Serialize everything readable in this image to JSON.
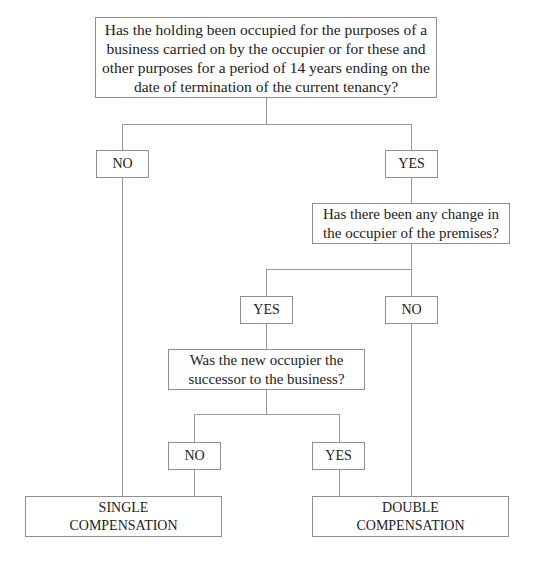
{
  "flowchart": {
    "q1": {
      "text": "Has the holding been occupied for the purposes of a business carried on by the occupier or for these and other purposes for a period of 14 years ending on the date of termination of the current tenancy?"
    },
    "q1_no": "NO",
    "q1_yes": "YES",
    "q2": {
      "text": "Has there been any change in the occupier of the premises?"
    },
    "q2_yes": "YES",
    "q2_no": "NO",
    "q3": {
      "text": "Was the new occupier the successor to the business?"
    },
    "q3_no": "NO",
    "q3_yes": "YES",
    "outcomes": {
      "single": "SINGLE COMPENSATION",
      "double": "DOUBLE COMPENSATION"
    },
    "colors": {
      "line": "#9a9a9a",
      "border": "#8f8f8f",
      "text": "#222222",
      "background": "#ffffff"
    }
  }
}
